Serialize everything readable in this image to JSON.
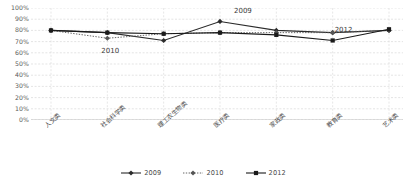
{
  "chart_data": {
    "type": "line",
    "title": "",
    "xlabel": "",
    "ylabel": "",
    "ylim": [
      0,
      1.0
    ],
    "grid": true,
    "legend_position": "bottom",
    "categories": [
      "人文类",
      "社会科学类",
      "理工农生物类",
      "医疗类",
      "家政类",
      "教育类",
      "艺术类"
    ],
    "ytick_labels": [
      "100%",
      "90%",
      "80%",
      "70%",
      "60%",
      "50%",
      "40%",
      "30%",
      "20%",
      "10%",
      "0%"
    ],
    "ytick_values": [
      1.0,
      0.9,
      0.8,
      0.7,
      0.6,
      0.5,
      0.4,
      0.3,
      0.2,
      0.1,
      0.0
    ],
    "series": [
      {
        "name": "2009",
        "style": "solid",
        "marker": "diamond",
        "color": "#2b2b2b",
        "values": [
          0.8,
          0.78,
          0.71,
          0.88,
          0.8,
          0.78,
          0.8
        ]
      },
      {
        "name": "2010",
        "style": "dotted",
        "marker": "diamond",
        "color": "#555555",
        "values": [
          0.8,
          0.73,
          0.77,
          0.78,
          0.78,
          0.78,
          0.8
        ]
      },
      {
        "name": "2012",
        "style": "solid",
        "marker": "square",
        "color": "#1a1a1a",
        "values": [
          0.8,
          0.78,
          0.77,
          0.78,
          0.76,
          0.71,
          0.81
        ]
      }
    ],
    "annotations": [
      {
        "text": "2010",
        "category": "社会科学类",
        "series": "2010"
      },
      {
        "text": "2009",
        "category": "医疗类",
        "series": "2009"
      },
      {
        "text": "2012",
        "category": "教育类",
        "series": "2012"
      }
    ]
  },
  "legend": {
    "entries": [
      {
        "label": "2009"
      },
      {
        "label": "2010"
      },
      {
        "label": "2012"
      }
    ]
  }
}
